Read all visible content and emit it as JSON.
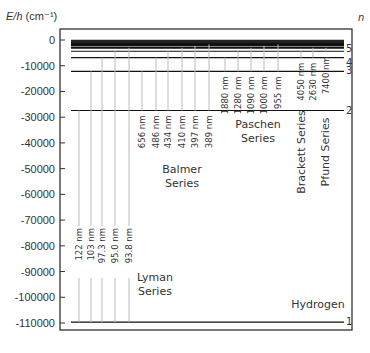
{
  "chart_data": {
    "type": "energy-level-diagram",
    "title": "Hydrogen",
    "ylabel": "E/h (cm⁻¹)",
    "ylabel_italic": "E/h",
    "ylabel_unit": "(cm⁻¹)",
    "right_label": "n",
    "ylim": [
      -115000,
      5000
    ],
    "yticks": [
      0,
      -10000,
      -20000,
      -30000,
      -40000,
      -50000,
      -60000,
      -70000,
      -80000,
      -90000,
      -100000,
      -110000
    ],
    "ytick_labels": [
      "0",
      "-10000",
      "-20000",
      "-30000",
      "-40000",
      "-50000",
      "-60000",
      "-70000",
      "-80000",
      "-90000",
      "-100000",
      "-110000"
    ],
    "levels": [
      {
        "n": 1,
        "energy": -109678,
        "label": "1"
      },
      {
        "n": 2,
        "energy": -27420,
        "label": "2"
      },
      {
        "n": 3,
        "energy": -12186,
        "label": "3"
      },
      {
        "n": 4,
        "energy": -6855,
        "label": "4"
      },
      {
        "n": 5,
        "energy": -4387,
        "label": "5"
      },
      {
        "n": 6,
        "energy": -3047,
        "label": ""
      },
      {
        "n": 7,
        "energy": -2238,
        "label": ""
      },
      {
        "n": 8,
        "energy": -1714,
        "label": ""
      },
      {
        "n": 9,
        "energy": -1354,
        "label": ""
      },
      {
        "n": 10,
        "energy": -1097,
        "label": ""
      }
    ],
    "series": [
      {
        "name": "Lyman Series",
        "label_lines": [
          "Lyman",
          "Series"
        ],
        "lower_n": 1,
        "transitions": [
          {
            "upper_n": 2,
            "wavelength": "122 nm"
          },
          {
            "upper_n": 3,
            "wavelength": "103 nm"
          },
          {
            "upper_n": 4,
            "wavelength": "97.3 nm"
          },
          {
            "upper_n": 5,
            "wavelength": "95.0 nm"
          },
          {
            "upper_n": 6,
            "wavelength": "93.8 nm"
          }
        ]
      },
      {
        "name": "Balmer Series",
        "label_lines": [
          "Balmer",
          "Series"
        ],
        "lower_n": 2,
        "transitions": [
          {
            "upper_n": 3,
            "wavelength": "656 nm"
          },
          {
            "upper_n": 4,
            "wavelength": "486 nm"
          },
          {
            "upper_n": 5,
            "wavelength": "434 nm"
          },
          {
            "upper_n": 6,
            "wavelength": "410 nm"
          },
          {
            "upper_n": 7,
            "wavelength": "397 nm"
          },
          {
            "upper_n": 8,
            "wavelength": "389 nm"
          }
        ]
      },
      {
        "name": "Paschen Series",
        "label_lines": [
          "Paschen",
          "Series"
        ],
        "lower_n": 3,
        "transitions": [
          {
            "upper_n": 4,
            "wavelength": "1880 nm"
          },
          {
            "upper_n": 5,
            "wavelength": "1280 nm"
          },
          {
            "upper_n": 6,
            "wavelength": "1090 nm"
          },
          {
            "upper_n": 7,
            "wavelength": "1000 nm"
          },
          {
            "upper_n": 8,
            "wavelength": "955 nm"
          }
        ]
      },
      {
        "name": "Brackett Series",
        "label_lines": [
          "Brackett Series"
        ],
        "lower_n": 4,
        "transitions": [
          {
            "upper_n": 5,
            "wavelength": "4050 nm"
          },
          {
            "upper_n": 6,
            "wavelength": "2630 nm"
          }
        ]
      },
      {
        "name": "Pfund Series",
        "label_lines": [
          "Pfund Series"
        ],
        "lower_n": 5,
        "transitions": [
          {
            "upper_n": 6,
            "wavelength": "7400 nm"
          }
        ]
      }
    ],
    "grid": false
  }
}
